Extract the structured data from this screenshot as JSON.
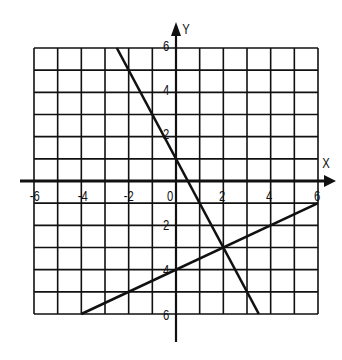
{
  "chart_data": {
    "type": "line",
    "title": "",
    "xlabel": "X",
    "ylabel": "Y",
    "xlim": [
      -6,
      6
    ],
    "ylim": [
      -6,
      6
    ],
    "grid": true,
    "x_ticks": [
      "-6",
      "-4",
      "-2",
      "0",
      "2",
      "4",
      "6"
    ],
    "y_ticks": [
      "6",
      "4",
      "2",
      "2",
      "4",
      "6"
    ],
    "series": [
      {
        "name": "line-1",
        "equation": "y = -2x + 1",
        "points": [
          [
            -2.5,
            6
          ],
          [
            3.5,
            -6
          ]
        ]
      },
      {
        "name": "line-2",
        "equation": "y = 0.5x - 4",
        "points": [
          [
            -4,
            -6
          ],
          [
            6,
            -1
          ]
        ]
      }
    ],
    "intersection": [
      2,
      -3
    ]
  },
  "labels": {
    "x_axis": "X",
    "y_axis": "Y",
    "x_tick_neg6": "-6",
    "x_tick_neg4": "-4",
    "x_tick_neg2": "-2",
    "x_tick_0": "0",
    "x_tick_2": "2",
    "x_tick_4": "4",
    "x_tick_6": "6",
    "y_tick_6": "6",
    "y_tick_4": "4",
    "y_tick_2": "2",
    "y_tick_neg2": "2",
    "y_tick_neg4": "4",
    "y_tick_neg6": "6"
  },
  "colors": {
    "ink": "#111111",
    "background": "#ffffff"
  }
}
